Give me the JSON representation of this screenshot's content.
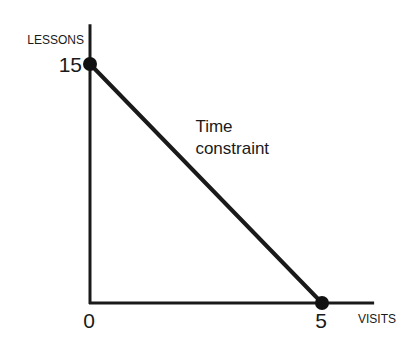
{
  "chart_data": {
    "type": "line",
    "title": "",
    "xlabel": "VISITS",
    "ylabel": "LESSONS",
    "xlim": [
      0,
      5.8
    ],
    "ylim": [
      0,
      17.5
    ],
    "grid": false,
    "legend": null,
    "x_ticks": [
      {
        "value": 0,
        "label": "0"
      },
      {
        "value": 5,
        "label": "5"
      }
    ],
    "y_ticks": [
      {
        "value": 15,
        "label": "15"
      }
    ],
    "series": [
      {
        "name": "Time constraint",
        "points": [
          {
            "x": 0,
            "y": 15
          },
          {
            "x": 5,
            "y": 0
          }
        ],
        "markers": true,
        "color": "#1a1a1a"
      }
    ],
    "annotations": [
      {
        "text_lines": [
          "Time",
          "constraint"
        ],
        "x": 2.25,
        "y": 10.5
      }
    ]
  }
}
